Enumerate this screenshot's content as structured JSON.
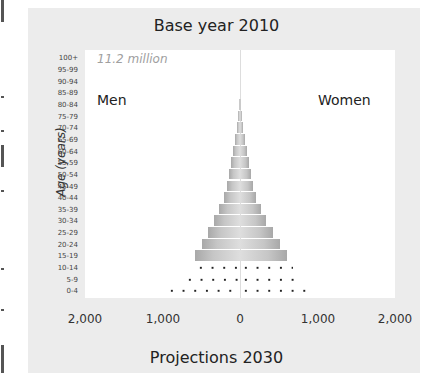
{
  "chart_data": {
    "type": "bar",
    "subtype": "population-pyramid",
    "title": "Base year 2010",
    "annotation": "11.2 million",
    "xlabel": "Projections 2030",
    "ylabel": "Age (years)",
    "left_label": "Men",
    "right_label": "Women",
    "x_ticks": [
      "2,000",
      "1,000",
      "0",
      "1,000",
      "2,000"
    ],
    "xlim": [
      -2000,
      2000
    ],
    "units": "thousands",
    "categories": [
      "0-4",
      "5-9",
      "10-14",
      "15-19",
      "20-24",
      "25-29",
      "30-34",
      "35-39",
      "40-44",
      "45-49",
      "50-54",
      "55-59",
      "60-64",
      "65-69",
      "70-74",
      "75-79",
      "80-84",
      "85-89",
      "90-94",
      "95-99",
      "100+"
    ],
    "series": [
      {
        "name": "Men (2010)",
        "values": [
          null,
          null,
          null,
          580,
          490,
          410,
          340,
          270,
          210,
          170,
          140,
          110,
          90,
          60,
          40,
          25,
          12,
          5,
          2,
          0,
          0
        ]
      },
      {
        "name": "Women (2010)",
        "values": [
          null,
          null,
          null,
          600,
          520,
          430,
          340,
          270,
          210,
          170,
          140,
          110,
          90,
          60,
          40,
          25,
          12,
          5,
          2,
          0,
          0
        ]
      },
      {
        "name": "Projections 2030 (Men)",
        "values": [
          950,
          720,
          580,
          null,
          null,
          null,
          null,
          null,
          null,
          null,
          null,
          null,
          null,
          null,
          null,
          null,
          null,
          null,
          null,
          null,
          null
        ]
      },
      {
        "name": "Projections 2030 (Women)",
        "values": [
          970,
          810,
          680,
          null,
          null,
          null,
          null,
          null,
          null,
          null,
          null,
          null,
          null,
          null,
          null,
          null,
          null,
          null,
          null,
          null,
          null
        ]
      }
    ],
    "grid": false,
    "legend_position": "none"
  }
}
